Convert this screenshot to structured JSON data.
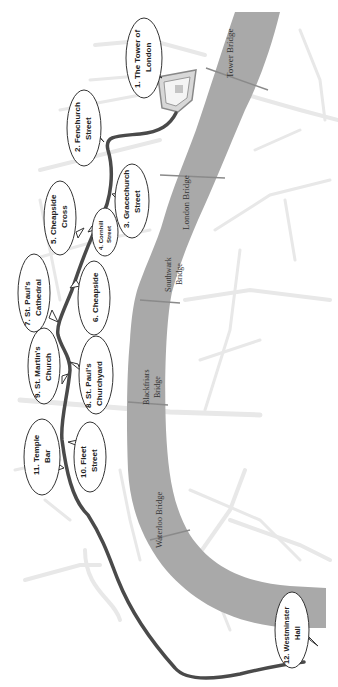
{
  "map": {
    "title": "Walking route from The Tower of London to Westminster Hall",
    "colors": {
      "background": "#ffffff",
      "river": "#a9a9a9",
      "route": "#4a4a4a",
      "streets": "#e6e6e6",
      "bubble_fill": "#ffffff",
      "bubble_stroke": "#333333"
    },
    "river": {
      "name": "River Thames"
    },
    "bridges": [
      {
        "id": "tower-bridge",
        "label": "Tower Bridge"
      },
      {
        "id": "london-bridge",
        "label": "London Bridge"
      },
      {
        "id": "southwark-bridge",
        "label_line1": "Southwark",
        "label_line2": "Bridge"
      },
      {
        "id": "blackfriars-bridge",
        "label_line1": "Blackfriars",
        "label_line2": "Bridge"
      },
      {
        "id": "waterloo-bridge",
        "label": "Waterloo Bridge"
      }
    ],
    "stops": [
      {
        "number": 1,
        "line1": "1. The Tower of",
        "line2": "London"
      },
      {
        "number": 2,
        "line1": "2. Fenchurch",
        "line2": "Street"
      },
      {
        "number": 3,
        "line1": "3. Gracechurch",
        "line2": "Street"
      },
      {
        "number": 4,
        "line1": "4. Cornhill",
        "line2": "Street"
      },
      {
        "number": 5,
        "line1": "5. Cheapside",
        "line2": "Cross"
      },
      {
        "number": 6,
        "line1": "6. Cheapside",
        "line2": ""
      },
      {
        "number": 7,
        "line1": "7. St. Paul's",
        "line2": "Cathedral"
      },
      {
        "number": 8,
        "line1": "8. St. Paul's",
        "line2": "Churchyard"
      },
      {
        "number": 9,
        "line1": "9. St. Martin's",
        "line2": "Church"
      },
      {
        "number": 10,
        "line1": "10. Fleet",
        "line2": "Street"
      },
      {
        "number": 11,
        "line1": "11. Temple",
        "line2": "Bar"
      },
      {
        "number": 12,
        "line1": "12. Westminster",
        "line2": "Hall"
      }
    ]
  }
}
